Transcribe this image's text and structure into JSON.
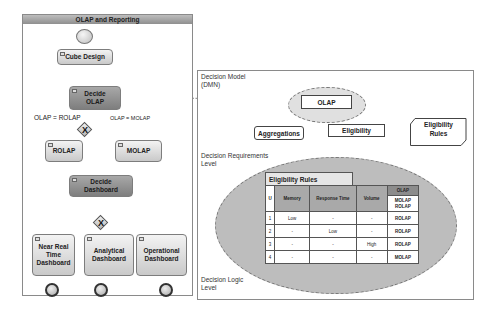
{
  "process": {
    "title": "OLAP and Reporting",
    "tasks": {
      "cube_design": "Cube Design",
      "decide_olap": [
        "Decide",
        "OLAP"
      ],
      "rolap": "ROLAP",
      "molap": "MOLAP",
      "decide_dashboard": [
        "Decide",
        "Dashboard"
      ],
      "near_real_time": [
        "Near Real",
        "Time",
        "Dashboard"
      ],
      "analytical": [
        "Analytical",
        "Dashboard"
      ],
      "operational": [
        "Operational",
        "Dashboard"
      ]
    },
    "conditions": {
      "rolap": "OLAP = ROLAP",
      "molap": "OLAP = MOLAP"
    },
    "gateway_symbol": "X"
  },
  "decision_model": {
    "labels": {
      "model": [
        "Decision Model",
        "(DMN)"
      ],
      "requirements": [
        "Decision Requirements",
        "Level"
      ],
      "logic": [
        "Decision Logic",
        "Level"
      ]
    },
    "nodes": {
      "olap": "OLAP",
      "aggregations": "Aggregations",
      "eligibility": "Eligibility",
      "eligibility_rules": [
        "Eligibility",
        "Rules"
      ]
    }
  },
  "decision_table": {
    "title": "Eligibility Rules",
    "hit_policy": "U",
    "inputs": [
      "Memory",
      "Response Time",
      "Volume"
    ],
    "output": {
      "name": "OLAP",
      "values": [
        "MOLAP",
        "ROLAP"
      ]
    },
    "rows": [
      {
        "n": "1",
        "memory": "Low",
        "response_time": "-",
        "volume": "-",
        "olap": "ROLAP"
      },
      {
        "n": "2",
        "memory": "-",
        "response_time": "Low",
        "volume": "-",
        "olap": "ROLAP"
      },
      {
        "n": "3",
        "memory": "-",
        "response_time": "-",
        "volume": "High",
        "olap": "ROLAP"
      },
      {
        "n": "4",
        "memory": "-",
        "response_time": "-",
        "volume": "-",
        "olap": "MOLAP"
      }
    ]
  }
}
